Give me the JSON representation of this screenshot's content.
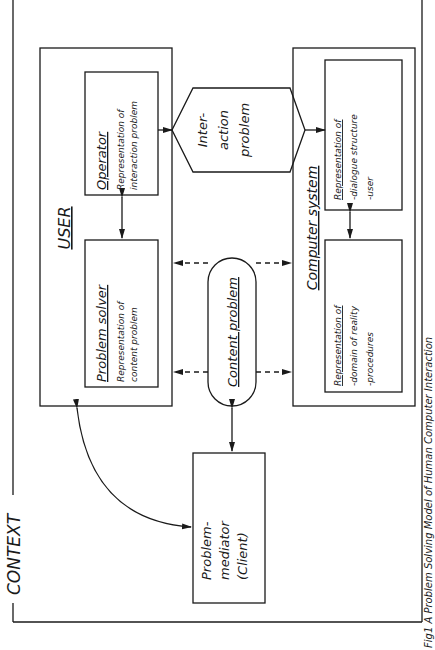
{
  "figure": {
    "context_label": "CONTEXT",
    "caption": "Fig1  A Problem  Solving  Model of Human  Computer  Interaction",
    "user": {
      "title": "USER",
      "operator": {
        "title": "Operator",
        "line1": "Representation of",
        "line2": "interaction problem"
      },
      "problem_solver": {
        "title": "Problem solver",
        "line1": "Representation of",
        "line2": "content problem"
      }
    },
    "interaction_problem": {
      "line1": "Inter-",
      "line2": "action",
      "line3": "problem"
    },
    "content_problem": {
      "title": "Content problem"
    },
    "problem_mediator": {
      "line1": "Problem-",
      "line2": "mediator",
      "line3": "(Client)"
    },
    "computer_system": {
      "title": "Computer system",
      "dialogue": {
        "title": "Representation of",
        "item1": "-dialogue structure",
        "item2": "-user"
      },
      "domain": {
        "title": "Representation of",
        "item1": "-domain of reality",
        "item2": "-procedures"
      }
    }
  }
}
